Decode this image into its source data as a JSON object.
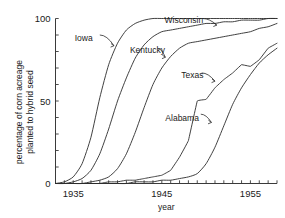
{
  "chart_data": {
    "type": "line",
    "title": "",
    "xlabel": "year",
    "ylabel_line1": "percentage of corn acreage",
    "ylabel_line2": "planted to hybrid seed",
    "xlim": [
      1933,
      1958
    ],
    "ylim": [
      0,
      100
    ],
    "grid": false,
    "legend_position": "inline-annotations",
    "x_ticks_labeled": [
      "1935",
      "1945",
      "1955"
    ],
    "x_ticks_labeled_values": [
      1935,
      1945,
      1955
    ],
    "x_tick_interval": 1,
    "y_ticks_labeled": [
      "0",
      "50",
      "100"
    ],
    "y_ticks_labeled_values": [
      0,
      50,
      100
    ],
    "y_tick_interval": 10,
    "series": [
      {
        "name": "Iowa",
        "label_x": 1937.0,
        "label_y": 88,
        "x": [
          1933,
          1934,
          1935,
          1936,
          1937,
          1938,
          1939,
          1940,
          1941,
          1942,
          1943,
          1944,
          1945,
          1946,
          1947,
          1948,
          1949,
          1950,
          1951,
          1952,
          1953,
          1954,
          1955,
          1956,
          1957,
          1958
        ],
        "values": [
          0,
          1,
          4,
          12,
          28,
          52,
          72,
          85,
          93,
          97,
          99,
          100,
          100,
          100,
          100,
          100,
          100,
          100,
          100,
          100,
          100,
          100,
          100,
          100,
          100,
          100
        ]
      },
      {
        "name": "Wisconsin",
        "label_x": 1946.5,
        "label_y": 99,
        "x": [
          1933,
          1934,
          1935,
          1936,
          1937,
          1938,
          1939,
          1940,
          1941,
          1942,
          1943,
          1944,
          1945,
          1946,
          1947,
          1948,
          1949,
          1950,
          1951,
          1952,
          1953,
          1954,
          1955,
          1956,
          1957,
          1958
        ],
        "values": [
          0,
          0,
          1,
          3,
          8,
          18,
          33,
          50,
          64,
          76,
          84,
          89,
          92,
          93,
          94,
          95,
          96,
          97,
          97,
          98,
          98,
          99,
          99,
          99,
          100,
          100
        ]
      },
      {
        "name": "Kentucky",
        "label_x": 1943.0,
        "label_y": 81,
        "x": [
          1933,
          1934,
          1935,
          1936,
          1937,
          1938,
          1939,
          1940,
          1941,
          1942,
          1943,
          1944,
          1945,
          1946,
          1947,
          1948,
          1949,
          1950,
          1951,
          1952,
          1953,
          1954,
          1955,
          1956,
          1957,
          1958
        ],
        "values": [
          0,
          0,
          0,
          0,
          1,
          2,
          4,
          9,
          18,
          31,
          46,
          60,
          70,
          77,
          82,
          85,
          86,
          87,
          88,
          89,
          90,
          91,
          92,
          94,
          95,
          97
        ]
      },
      {
        "name": "Texas",
        "label_x": 1948.0,
        "label_y": 66,
        "x": [
          1933,
          1934,
          1935,
          1936,
          1937,
          1938,
          1939,
          1940,
          1941,
          1942,
          1943,
          1944,
          1945,
          1946,
          1947,
          1948,
          1949,
          1950,
          1951,
          1952,
          1953,
          1954,
          1955,
          1956,
          1957,
          1958
        ],
        "values": [
          0,
          0,
          0,
          0,
          0,
          0,
          1,
          1,
          2,
          2,
          3,
          4,
          5,
          8,
          16,
          26,
          50,
          51,
          58,
          63,
          67,
          72,
          71,
          75,
          82,
          85
        ]
      },
      {
        "name": "Alabama",
        "label_x": 1946.5,
        "label_y": 40,
        "x": [
          1933,
          1934,
          1935,
          1936,
          1937,
          1938,
          1939,
          1940,
          1941,
          1942,
          1943,
          1944,
          1945,
          1946,
          1947,
          1948,
          1949,
          1950,
          1951,
          1952,
          1953,
          1954,
          1955,
          1956,
          1957,
          1958
        ],
        "values": [
          0,
          0,
          0,
          0,
          0,
          0,
          0,
          0,
          0,
          1,
          1,
          1,
          2,
          2,
          3,
          4,
          6,
          12,
          22,
          35,
          48,
          58,
          66,
          73,
          78,
          82
        ]
      }
    ]
  },
  "annotations": {
    "iowa_label": "Iowa",
    "wisconsin_label": "Wisconsin",
    "kentucky_label": "Kentucky",
    "texas_label": "Texas",
    "alabama_label": "Alabama"
  },
  "axis": {
    "x_title": "year",
    "y_title_line1": "percentage of corn acreage",
    "y_title_line2": "planted to hybrid seed",
    "x_label_1935": "1935",
    "x_label_1945": "1945",
    "x_label_1955": "1955",
    "y_label_0": "0",
    "y_label_50": "50",
    "y_label_100": "100"
  }
}
